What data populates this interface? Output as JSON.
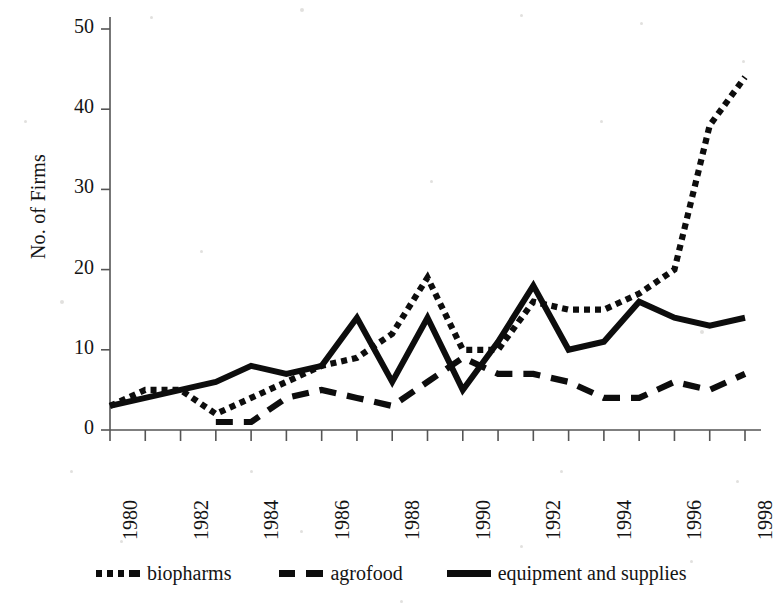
{
  "chart_data": {
    "type": "line",
    "title": "",
    "xlabel": "",
    "ylabel": "No. of Firms",
    "xlim": [
      1980,
      1998
    ],
    "ylim": [
      0,
      50
    ],
    "grid": false,
    "legend_position": "bottom",
    "x": [
      1980,
      1981,
      1982,
      1983,
      1984,
      1985,
      1986,
      1987,
      1988,
      1989,
      1990,
      1991,
      1992,
      1993,
      1994,
      1995,
      1996,
      1997,
      1998
    ],
    "ytick_labels": [
      "0",
      "10",
      "20",
      "30",
      "40",
      "50"
    ],
    "ytick_values": [
      0,
      10,
      20,
      30,
      40,
      50
    ],
    "xtick_labels": [
      "1980",
      "1982",
      "1984",
      "1986",
      "1988",
      "1990",
      "1992",
      "1994",
      "1996",
      "1998"
    ],
    "xtick_values": [
      1980,
      1982,
      1984,
      1986,
      1988,
      1990,
      1992,
      1994,
      1996,
      1998
    ],
    "series": [
      {
        "name": "biopharms",
        "style": "dotted",
        "color": "#0d0d0d",
        "x": [
          1980,
          1981,
          1982,
          1983,
          1984,
          1985,
          1986,
          1987,
          1988,
          1989,
          1990,
          1991,
          1992,
          1993,
          1994,
          1995,
          1996,
          1997,
          1998
        ],
        "values": [
          3,
          5,
          5,
          2,
          4,
          6,
          8,
          9,
          12,
          19,
          10,
          10,
          16,
          15,
          15,
          17,
          20,
          38,
          44
        ]
      },
      {
        "name": "agrofood",
        "style": "dashed",
        "color": "#0d0d0d",
        "x": [
          1983,
          1984,
          1985,
          1986,
          1987,
          1988,
          1989,
          1990,
          1991,
          1992,
          1993,
          1994,
          1995,
          1996,
          1997,
          1998
        ],
        "values": [
          1,
          1,
          4,
          5,
          4,
          3,
          6,
          9,
          7,
          7,
          6,
          4,
          4,
          6,
          5,
          7
        ]
      },
      {
        "name": "equipment and supplies",
        "style": "solid",
        "color": "#0d0d0d",
        "x": [
          1980,
          1981,
          1982,
          1983,
          1984,
          1985,
          1986,
          1987,
          1988,
          1989,
          1990,
          1991,
          1992,
          1993,
          1994,
          1995,
          1996,
          1997,
          1998
        ],
        "values": [
          3,
          4,
          5,
          6,
          8,
          7,
          8,
          14,
          6,
          14,
          5,
          11,
          18,
          10,
          11,
          16,
          14,
          13,
          14
        ]
      }
    ]
  },
  "legend": {
    "items": [
      {
        "label": "biopharms",
        "style": "dotted"
      },
      {
        "label": "agrofood",
        "style": "dashed"
      },
      {
        "label": "equipment and supplies",
        "style": "solid"
      }
    ]
  }
}
